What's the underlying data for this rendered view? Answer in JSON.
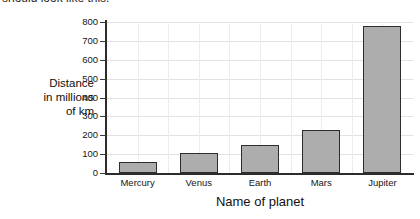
{
  "caption": {
    "text": "should look like this."
  },
  "chart_data": {
    "type": "bar",
    "title": "",
    "categories": [
      "Mercury",
      "Venus",
      "Earth",
      "Mars",
      "Jupiter"
    ],
    "values": [
      58,
      108,
      150,
      228,
      778
    ],
    "xlabel": "Name of planet",
    "ylabel": "Distance in millions of km",
    "ylabel_lines": [
      "Distance",
      "in millions",
      "of km"
    ],
    "ylim": [
      0,
      800
    ],
    "ytick_values": [
      0,
      100,
      200,
      300,
      400,
      500,
      600,
      700,
      800
    ],
    "ytick_labels": [
      "0",
      "100",
      "200",
      "300",
      "400",
      "500",
      "600",
      "700",
      "800"
    ],
    "grid": true,
    "legend": false,
    "bar_color": "#adadad",
    "bar_edge_color": "#2d2d2d",
    "axis_color": "#2c2c2c",
    "grid_color": "#e2e2e2",
    "background": "#ffffff"
  }
}
